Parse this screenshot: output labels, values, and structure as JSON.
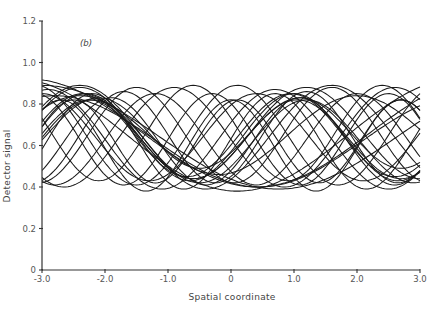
{
  "figure": {
    "panel_label": "(b)",
    "caption_partial": "Figure ..."
  },
  "chart_data": {
    "type": "line",
    "title": "",
    "panel": "(b)",
    "xlabel": "Spatial coordinate",
    "ylabel": "Detector signal",
    "xlim": [
      -3.0,
      3.0
    ],
    "ylim": [
      0,
      1.2
    ],
    "xticks": [
      -3.0,
      -2.0,
      -1.0,
      0,
      1.0,
      2.0,
      3.0
    ],
    "xtick_labels": [
      "-3.0",
      "-2.0",
      "-1.0",
      "0",
      "1.0",
      "2.0",
      "3.0"
    ],
    "yticks": [
      0,
      0.2,
      0.4,
      0.6,
      0.8,
      1.0,
      1.2
    ],
    "ytick_labels": [
      "0",
      "0.2",
      "0.4",
      "0.6",
      "0.8",
      "1.0",
      "1.2"
    ],
    "grid": false,
    "legend": null,
    "series_model": "y = offset + amp * cos(2*pi*(x - phase)/period)",
    "series": [
      {
        "name": "trace-1",
        "offset": 0.65,
        "amp": 0.2,
        "period": 3.3,
        "phase": -2.35
      },
      {
        "name": "trace-2",
        "offset": 0.64,
        "amp": 0.21,
        "period": 3.3,
        "phase": -2.3
      },
      {
        "name": "trace-3",
        "offset": 0.63,
        "amp": 0.19,
        "period": 3.3,
        "phase": -2.25
      },
      {
        "name": "trace-4",
        "offset": 0.62,
        "amp": 0.2,
        "period": 3.4,
        "phase": -2.2
      },
      {
        "name": "trace-5",
        "offset": 0.66,
        "amp": 0.17,
        "period": 3.2,
        "phase": -2.1
      },
      {
        "name": "trace-6",
        "offset": 0.65,
        "amp": 0.27,
        "period": 7.0,
        "phase": -3.4
      },
      {
        "name": "trace-7",
        "offset": 0.66,
        "amp": 0.26,
        "period": 7.2,
        "phase": -3.2
      },
      {
        "name": "trace-8",
        "offset": 0.64,
        "amp": 0.25,
        "period": 7.5,
        "phase": -3.0
      },
      {
        "name": "trace-9",
        "offset": 0.62,
        "amp": 0.22,
        "period": 6.5,
        "phase": -2.8
      },
      {
        "name": "trace-10",
        "offset": 0.63,
        "amp": 0.24,
        "period": 3.6,
        "phase": -2.9
      },
      {
        "name": "trace-11",
        "offset": 0.62,
        "amp": 0.21,
        "period": 3.0,
        "phase": -1.9
      },
      {
        "name": "trace-12",
        "offset": 0.64,
        "amp": 0.22,
        "period": 2.9,
        "phase": -1.7
      },
      {
        "name": "trace-13",
        "offset": 0.65,
        "amp": 0.23,
        "period": 3.1,
        "phase": -1.5
      },
      {
        "name": "trace-14",
        "offset": 0.63,
        "amp": 0.22,
        "period": 3.2,
        "phase": -1.2
      },
      {
        "name": "trace-15",
        "offset": 0.64,
        "amp": 0.24,
        "period": 3.5,
        "phase": -0.9
      },
      {
        "name": "trace-16",
        "offset": 0.66,
        "amp": 0.23,
        "period": 3.0,
        "phase": -0.6
      },
      {
        "name": "trace-17",
        "offset": 0.63,
        "amp": 0.22,
        "period": 2.8,
        "phase": -0.3
      },
      {
        "name": "trace-18",
        "offset": 0.65,
        "amp": 0.24,
        "period": 3.2,
        "phase": 0.1
      },
      {
        "name": "trace-19",
        "offset": 0.64,
        "amp": 0.21,
        "period": 3.4,
        "phase": 0.4
      },
      {
        "name": "trace-20",
        "offset": 0.62,
        "amp": 0.23,
        "period": 2.9,
        "phase": 0.7
      },
      {
        "name": "trace-21",
        "offset": 0.66,
        "amp": 0.22,
        "period": 3.6,
        "phase": 1.2
      },
      {
        "name": "trace-22",
        "offset": 0.64,
        "amp": 0.25,
        "period": 4.0,
        "phase": 1.6
      },
      {
        "name": "trace-23",
        "offset": 0.6,
        "amp": 0.22,
        "period": 2.7,
        "phase": -2.7
      },
      {
        "name": "trace-24",
        "offset": 0.62,
        "amp": 0.2,
        "period": 2.6,
        "phase": -2.5
      },
      {
        "name": "trace-25",
        "offset": 0.65,
        "amp": 0.19,
        "period": 4.4,
        "phase": 2.0
      }
    ]
  }
}
